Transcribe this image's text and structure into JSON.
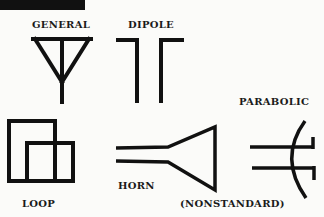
{
  "diagram": {
    "symbols": [
      {
        "id": "general",
        "label": "GENERAL"
      },
      {
        "id": "dipole",
        "label": "DIPOLE"
      },
      {
        "id": "parabolic",
        "label": "PARABOLIC"
      },
      {
        "id": "loop",
        "label": "LOOP"
      },
      {
        "id": "horn",
        "label": "HORN"
      },
      {
        "id": "horn-note",
        "label": "(NONSTANDARD)"
      }
    ],
    "colors": {
      "stroke": "#111111",
      "background": "#fbfbf9"
    }
  }
}
